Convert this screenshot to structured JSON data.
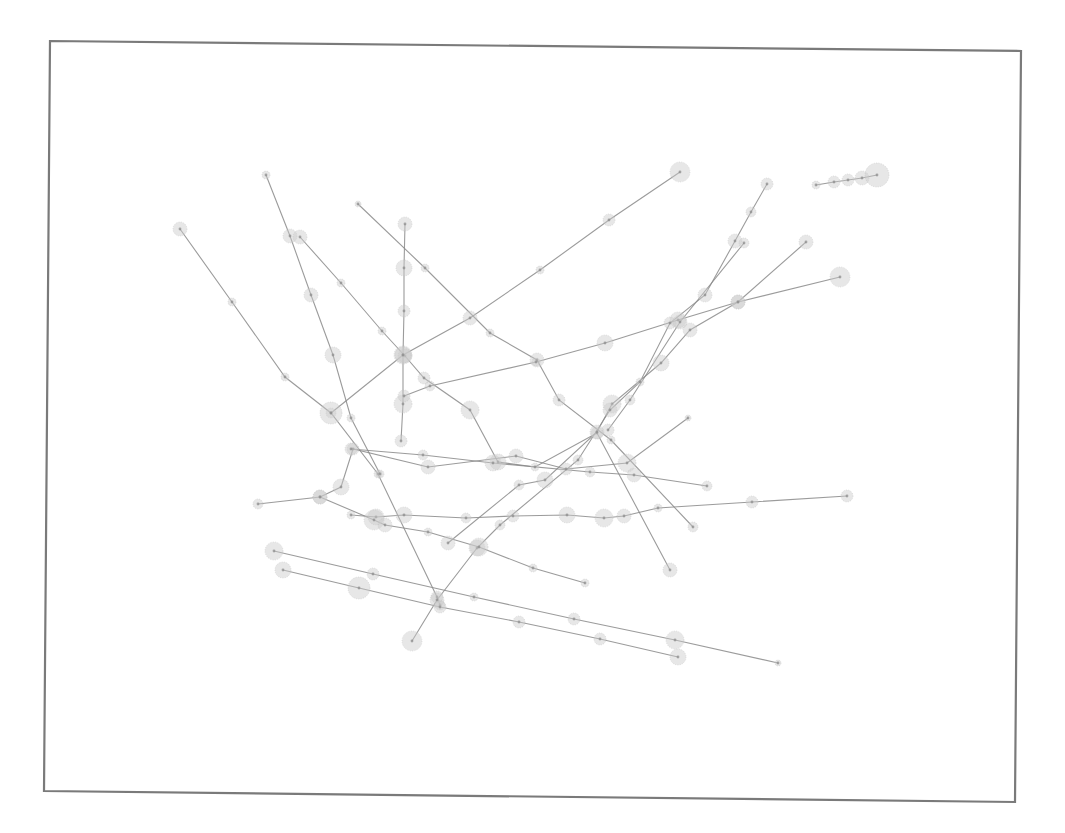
{
  "diagram": {
    "type": "trajectory-plot",
    "frame": {
      "corners": [
        [
          50,
          41
        ],
        [
          1021,
          51
        ],
        [
          1015,
          802
        ],
        [
          44,
          791
        ]
      ],
      "stroke": "#7a7a7a"
    },
    "style": {
      "line_color": "#8a8a8a",
      "node_fill": "#c9c9c9",
      "core_color": "#8c8c8c"
    },
    "trajectories": [
      {
        "id": "t1",
        "points": [
          [
            180,
            229,
            7
          ],
          [
            232,
            302,
            4
          ],
          [
            285,
            377,
            4
          ],
          [
            331,
            413,
            5
          ],
          [
            378,
            474,
            4
          ],
          [
            437,
            597,
            6
          ],
          [
            440,
            605,
            5
          ]
        ]
      },
      {
        "id": "t2",
        "points": [
          [
            266,
            175,
            4
          ],
          [
            290,
            236,
            7
          ],
          [
            311,
            295,
            7
          ],
          [
            333,
            355,
            8
          ],
          [
            351,
            418,
            4
          ],
          [
            380,
            474,
            4
          ]
        ]
      },
      {
        "id": "t3",
        "points": [
          [
            300,
            237,
            7
          ],
          [
            341,
            283,
            4
          ],
          [
            382,
            331,
            4
          ],
          [
            405,
            356,
            7
          ],
          [
            424,
            378,
            6
          ],
          [
            470,
            410,
            9
          ],
          [
            498,
            462,
            8
          ],
          [
            535,
            467,
            4
          ],
          [
            597,
            433,
            6
          ],
          [
            670,
            570,
            7
          ]
        ]
      },
      {
        "id": "t4",
        "points": [
          [
            358,
            204,
            3
          ],
          [
            425,
            268,
            4
          ],
          [
            490,
            333,
            4
          ],
          [
            537,
            360,
            7
          ],
          [
            559,
            400,
            6
          ],
          [
            611,
            440,
            4
          ],
          [
            693,
            527,
            5
          ]
        ]
      },
      {
        "id": "t5",
        "points": [
          [
            405,
            224,
            7
          ],
          [
            404,
            268,
            8
          ],
          [
            404,
            311,
            6
          ],
          [
            403,
            355,
            9
          ],
          [
            403,
            404,
            9
          ],
          [
            401,
            441,
            6
          ]
        ]
      },
      {
        "id": "t6",
        "points": [
          [
            680,
            172,
            10
          ],
          [
            609,
            220,
            6
          ],
          [
            540,
            270,
            4
          ],
          [
            470,
            318,
            7
          ],
          [
            403,
            355,
            8
          ],
          [
            331,
            413,
            11
          ]
        ]
      },
      {
        "id": "t7",
        "points": [
          [
            840,
            277,
            10
          ],
          [
            738,
            302,
            7
          ],
          [
            678,
            320,
            8
          ],
          [
            605,
            343,
            8
          ],
          [
            536,
            362,
            4
          ],
          [
            430,
            386,
            5
          ],
          [
            404,
            396,
            6
          ]
        ]
      },
      {
        "id": "t8",
        "points": [
          [
            806,
            242,
            7
          ],
          [
            738,
            302,
            7
          ],
          [
            690,
            330,
            7
          ],
          [
            661,
            363,
            8
          ],
          [
            612,
            404,
            9
          ],
          [
            597,
            432,
            7
          ],
          [
            545,
            480,
            8
          ],
          [
            519,
            485,
            5
          ],
          [
            448,
            543,
            7
          ]
        ]
      },
      {
        "id": "t9",
        "points": [
          [
            767,
            184,
            6
          ],
          [
            751,
            212,
            5
          ],
          [
            735,
            241,
            7
          ],
          [
            705,
            295,
            7
          ],
          [
            670,
            323,
            6
          ],
          [
            640,
            382,
            4
          ],
          [
            610,
            410,
            7
          ],
          [
            578,
            460,
            5
          ],
          [
            500,
            525,
            5
          ],
          [
            477,
            548,
            8
          ],
          [
            437,
            600,
            7
          ],
          [
            412,
            641,
            10
          ]
        ]
      },
      {
        "id": "t10",
        "points": [
          [
            744,
            243,
            5
          ],
          [
            680,
            322,
            7
          ],
          [
            630,
            400,
            5
          ],
          [
            608,
            430,
            6
          ]
        ]
      },
      {
        "id": "t11",
        "points": [
          [
            816,
            185,
            4
          ],
          [
            834,
            182,
            6
          ],
          [
            848,
            180,
            6
          ],
          [
            862,
            178,
            7
          ],
          [
            877,
            175,
            12
          ]
        ]
      },
      {
        "id": "t12",
        "points": [
          [
            688,
            418,
            3
          ],
          [
            627,
            463,
            9
          ],
          [
            566,
            469,
            6
          ],
          [
            516,
            456,
            7
          ],
          [
            428,
            467,
            7
          ],
          [
            353,
            449,
            6
          ],
          [
            341,
            487,
            8
          ],
          [
            320,
            497,
            7
          ],
          [
            258,
            504,
            5
          ]
        ]
      },
      {
        "id": "t13",
        "points": [
          [
            351,
            449,
            6
          ],
          [
            423,
            455,
            5
          ],
          [
            493,
            463,
            8
          ],
          [
            590,
            472,
            5
          ],
          [
            634,
            475,
            7
          ],
          [
            707,
            486,
            5
          ]
        ]
      },
      {
        "id": "t14",
        "points": [
          [
            847,
            496,
            6
          ],
          [
            752,
            502,
            6
          ],
          [
            658,
            508,
            4
          ],
          [
            624,
            516,
            7
          ],
          [
            604,
            518,
            9
          ],
          [
            567,
            515,
            8
          ],
          [
            513,
            516,
            6
          ],
          [
            466,
            518,
            5
          ],
          [
            404,
            515,
            8
          ],
          [
            376,
            517,
            8
          ],
          [
            351,
            515,
            4
          ]
        ]
      },
      {
        "id": "t15",
        "points": [
          [
            320,
            497,
            7
          ],
          [
            374,
            520,
            10
          ],
          [
            385,
            525,
            7
          ],
          [
            428,
            532,
            4
          ],
          [
            479,
            547,
            9
          ],
          [
            533,
            568,
            4
          ],
          [
            585,
            583,
            4
          ]
        ]
      },
      {
        "id": "t16",
        "points": [
          [
            274,
            551,
            9
          ],
          [
            373,
            574,
            6
          ],
          [
            474,
            597,
            4
          ],
          [
            574,
            619,
            6
          ],
          [
            675,
            640,
            9
          ],
          [
            778,
            663,
            3
          ]
        ]
      },
      {
        "id": "t17",
        "points": [
          [
            283,
            570,
            8
          ],
          [
            359,
            588,
            11
          ],
          [
            440,
            607,
            6
          ],
          [
            519,
            622,
            6
          ],
          [
            600,
            639,
            6
          ],
          [
            678,
            657,
            8
          ]
        ]
      }
    ]
  }
}
